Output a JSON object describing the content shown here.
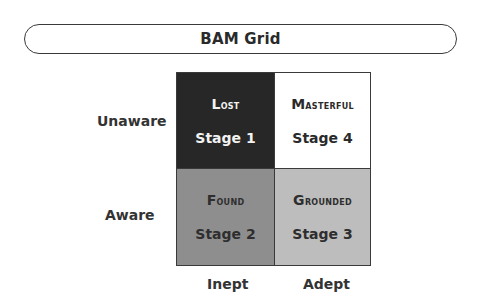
{
  "title": "BAM Grid",
  "rows": [
    "Unaware",
    "Aware"
  ],
  "columns": [
    "Inept",
    "Adept"
  ],
  "cells": {
    "lost": {
      "name": "Lost",
      "stage": "Stage 1",
      "color": "#272727"
    },
    "masterful": {
      "name": "Masterful",
      "stage": "Stage 4",
      "color": "#ffffff"
    },
    "found": {
      "name": "Found",
      "stage": "Stage 2",
      "color": "#8e8e8e"
    },
    "grounded": {
      "name": "Grounded",
      "stage": "Stage 3",
      "color": "#bdbdbd"
    }
  }
}
